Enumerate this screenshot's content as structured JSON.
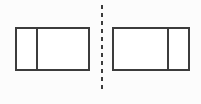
{
  "figure": {
    "type": "geometry-diagram",
    "canvas": {
      "width": 201,
      "height": 104,
      "background_color": "#fcfcfc"
    },
    "stroke_color": "#3c3c3c",
    "fill_color": "#ffffff",
    "shapes": {
      "left_rectangle": {
        "label": "left-rectangle",
        "x": 16,
        "y": 28,
        "width": 73,
        "height": 42,
        "partitions": 2,
        "divider_offsets": [
          21
        ],
        "divider_x": [
          37
        ],
        "part_widths": [
          21,
          52
        ],
        "small_part_side": "left"
      },
      "right_rectangle": {
        "label": "right-rectangle",
        "x": 113,
        "y": 28,
        "width": 76,
        "height": 42,
        "partitions": 2,
        "divider_offsets": [
          55
        ],
        "divider_x": [
          168
        ],
        "part_widths": [
          55,
          21
        ],
        "small_part_side": "right"
      },
      "mirror_line": {
        "label": "line-of-symmetry",
        "orientation": "vertical",
        "x": 102,
        "y_start": 5,
        "y_end": 93,
        "style": "dashed",
        "dash_length": 4,
        "gap_length": 4
      }
    }
  }
}
